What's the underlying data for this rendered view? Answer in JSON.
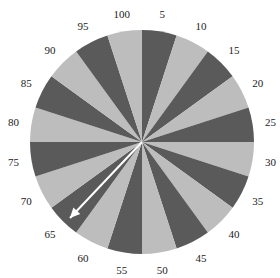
{
  "spinner": {
    "center": [
      142,
      142
    ],
    "radius": 112,
    "label_radius": 130,
    "sector_count": 20,
    "colors": {
      "light": "#bdbdbd",
      "dark": "#5a5a5a",
      "arrow": "#ffffff"
    },
    "labels": [
      "5",
      "10",
      "15",
      "20",
      "25",
      "30",
      "35",
      "40",
      "45",
      "50",
      "55",
      "60",
      "65",
      "70",
      "75",
      "80",
      "85",
      "90",
      "95",
      "100"
    ],
    "arrow": {
      "tip": [
        70,
        218
      ],
      "points_to": "65"
    }
  }
}
